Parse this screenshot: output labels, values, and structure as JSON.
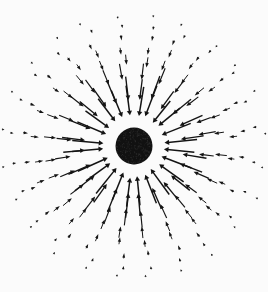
{
  "figure": {
    "name": "radial-inward-vector-field",
    "width": 268,
    "height": 292,
    "background_color": "#fbfbfb",
    "ink_color": "#141414"
  },
  "central_body": {
    "label": "central-mass-disk",
    "center_x": 134,
    "center_y": 146,
    "radius": 18.5,
    "fill_color": "#111111",
    "texture": "dithered-grain",
    "texture_speck_color": "#3a3a3a",
    "texture_speck_count": 260
  },
  "field": {
    "direction": "inward",
    "arrow_color": "#141414",
    "arrowhead_position": "inner-end",
    "arrowhead_length": 4.6,
    "arrowhead_half_width": 2.1,
    "shaft_min_width": 0.55,
    "shaft_max_width": 1.5,
    "spokes_per_ring": 24,
    "angular_offset_degrees": 7.5,
    "angular_jitter_degrees": 2.6,
    "radial_jitter": 2.4,
    "length_model": "inverse-distance-decay",
    "seed": 20414,
    "rings": [
      {
        "index": 0,
        "radius": 30,
        "arrow_length": 30.0,
        "shaft_width": 1.5,
        "count": 24
      },
      {
        "index": 1,
        "radius": 48,
        "arrow_length": 23.0,
        "shaft_width": 1.35,
        "count": 24
      },
      {
        "index": 2,
        "radius": 65,
        "arrow_length": 16.0,
        "shaft_width": 1.15,
        "count": 24
      },
      {
        "index": 3,
        "radius": 80,
        "arrow_length": 11.0,
        "shaft_width": 1.0,
        "count": 24
      },
      {
        "index": 4,
        "radius": 94,
        "arrow_length": 7.6,
        "shaft_width": 0.9,
        "count": 24
      },
      {
        "index": 5,
        "radius": 107,
        "arrow_length": 5.2,
        "shaft_width": 0.8,
        "count": 24
      },
      {
        "index": 6,
        "radius": 119,
        "arrow_length": 3.6,
        "shaft_width": 0.7,
        "count": 24
      },
      {
        "index": 7,
        "radius": 130,
        "arrow_length": 2.4,
        "shaft_width": 0.62,
        "count": 24
      }
    ]
  },
  "clip": {
    "left": 0,
    "top": 0,
    "right": 268,
    "bottom": 292
  }
}
